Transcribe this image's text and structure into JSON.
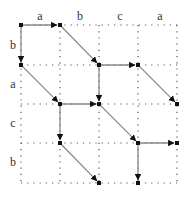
{
  "diagram": {
    "type": "edit-graph alignment grid",
    "top_labels": [
      "a",
      "b",
      "c",
      "a"
    ],
    "left_labels": [
      "b",
      "a",
      "c",
      "b"
    ],
    "grid": {
      "xs": [
        21,
        60,
        99,
        138,
        177
      ],
      "ys": [
        25,
        65,
        104,
        143,
        183
      ],
      "style": "dotted"
    },
    "colors": {
      "grid": "#555555",
      "edge": "#888888",
      "node": "#111111",
      "label": "#333333"
    },
    "edges": [
      {
        "from": [
          0,
          0
        ],
        "to": [
          1,
          0
        ],
        "kind": "horizontal"
      },
      {
        "from": [
          0,
          0
        ],
        "to": [
          0,
          1
        ],
        "kind": "vertical"
      },
      {
        "from": [
          1,
          0
        ],
        "to": [
          2,
          1
        ],
        "kind": "diagonal"
      },
      {
        "from": [
          0,
          1
        ],
        "to": [
          1,
          2
        ],
        "kind": "diagonal"
      },
      {
        "from": [
          2,
          1
        ],
        "to": [
          3,
          1
        ],
        "kind": "horizontal"
      },
      {
        "from": [
          2,
          1
        ],
        "to": [
          2,
          2
        ],
        "kind": "vertical"
      },
      {
        "from": [
          3,
          1
        ],
        "to": [
          4,
          2
        ],
        "kind": "diagonal"
      },
      {
        "from": [
          1,
          2
        ],
        "to": [
          2,
          2
        ],
        "kind": "horizontal"
      },
      {
        "from": [
          1,
          2
        ],
        "to": [
          1,
          3
        ],
        "kind": "vertical"
      },
      {
        "from": [
          2,
          2
        ],
        "to": [
          3,
          3
        ],
        "kind": "diagonal"
      },
      {
        "from": [
          1,
          3
        ],
        "to": [
          2,
          4
        ],
        "kind": "diagonal"
      },
      {
        "from": [
          3,
          3
        ],
        "to": [
          4,
          3
        ],
        "kind": "horizontal"
      },
      {
        "from": [
          3,
          3
        ],
        "to": [
          3,
          4
        ],
        "kind": "vertical"
      }
    ]
  }
}
